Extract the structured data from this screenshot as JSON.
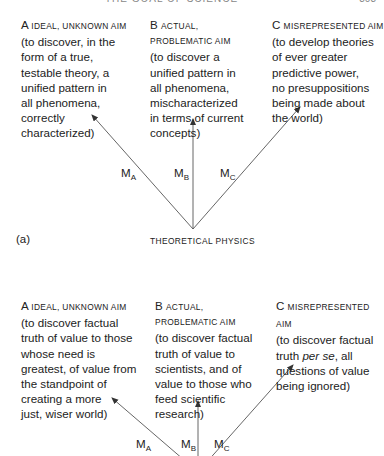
{
  "page_header": {
    "running_title": "THE GOAL OF SCIENCE",
    "page_number": "303"
  },
  "diagram_a": {
    "panel_label": "(a)",
    "base_label": "THEORETICAL PHYSICS",
    "aims": [
      {
        "letter": "A",
        "heading": "IDEAL, UNKNOWN AIM",
        "body": "(to discover, in the\nform of a true,\ntestable theory, a\nunified pattern in\nall phenomena,\ncorrectly\ncharacterized)"
      },
      {
        "letter": "B",
        "heading_line1": "ACTUAL,",
        "heading_line2": "PROBLEMATIC AIM",
        "body": "(to discover a\nunified pattern in\nall phenomena,\nmischaracterized\nin terms of current\nconcepts)"
      },
      {
        "letter": "C",
        "heading": "MISREPRESENTED AIM",
        "body": "(to develop theories\nof ever greater\npredictive power,\nno presuppositions\nbeing made about\nthe world)"
      }
    ],
    "methods": [
      {
        "main": "M",
        "sub": "A"
      },
      {
        "main": "M",
        "sub": "B"
      },
      {
        "main": "M",
        "sub": "C"
      }
    ]
  },
  "diagram_b": {
    "aims": [
      {
        "letter": "A",
        "heading": "IDEAL, UNKNOWN AIM",
        "body": "(to discover factual\ntruth of value to those\nwhose need is\ngreatest, of value from\nthe standpoint of\ncreating a more\njust, wiser world)"
      },
      {
        "letter": "B",
        "heading_line1": "ACTUAL,",
        "heading_line2": "PROBLEMATIC AIM",
        "body": "(to discover factual\ntruth of value to\nscientists, and of\nvalue to those who\nfeed scientific\nresearch)"
      },
      {
        "letter": "C",
        "heading": "MISREPRESENTED AIM",
        "body_pre": "(to discover factual\ntruth ",
        "body_italic": "per se",
        "body_post": ", all\nquestions of value\nbeing ignored)"
      }
    ],
    "methods": [
      {
        "main": "M",
        "sub": "A"
      },
      {
        "main": "M",
        "sub": "B"
      },
      {
        "main": "M",
        "sub": "C"
      }
    ]
  },
  "colors": {
    "text": "#222222",
    "line": "#555555",
    "background": "#ffffff"
  }
}
